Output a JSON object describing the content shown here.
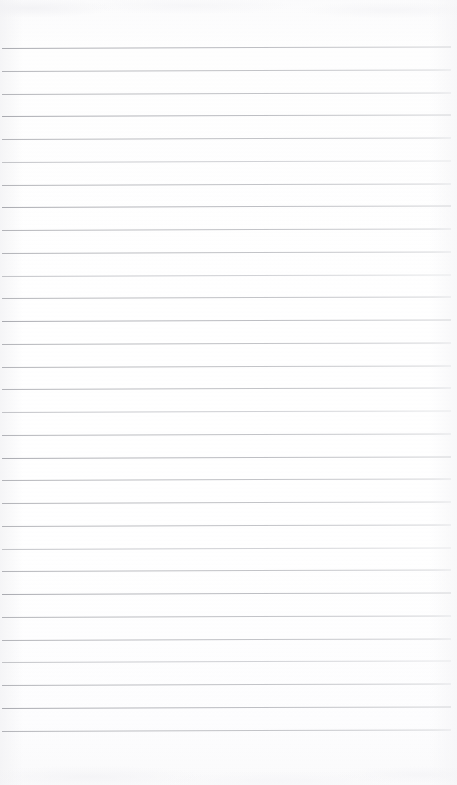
{
  "document": {
    "kind": "scanned-page",
    "title": "Blank Ruled Notebook Page",
    "page_text": "",
    "has_handwriting": false,
    "has_printed_text": false,
    "width_px": 457,
    "height_px": 785
  },
  "paper": {
    "background_color": "#fdfdfe",
    "edge_tint_color": "#f3f3f5",
    "texture": "faint-scan-noise"
  },
  "ruling": {
    "style": "horizontal-ruled",
    "line_color": "#b9babe",
    "line_color_light": "#cfd0d4",
    "line_thickness_px": 1,
    "line_count": 31,
    "first_line_y": 48,
    "line_spacing_px": 22.75,
    "line_left_x": 2,
    "line_right_x": 451,
    "skew_px": -1.6,
    "top_margin_px": 48,
    "bottom_margin_px": 54,
    "emphasis": {
      "strong_indices": [
        0,
        3,
        7,
        12,
        18,
        24,
        29
      ],
      "faint_indices": [
        5,
        10,
        16,
        22,
        27
      ]
    }
  },
  "content": {
    "regions": [
      {
        "name": "top-margin",
        "label": ""
      },
      {
        "name": "ruled-body",
        "label": ""
      },
      {
        "name": "bottom-margin",
        "label": ""
      }
    ]
  }
}
